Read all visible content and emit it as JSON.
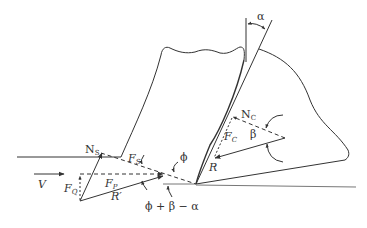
{
  "diagram": {
    "type": "orthogonal-cutting-force-diagram",
    "labels": {
      "alpha": "α",
      "phi": "ϕ",
      "beta": "β",
      "velocity": "V",
      "shear_normal": "N",
      "shear_normal_sub": "S",
      "shear_force": "F",
      "shear_force_sub": "S",
      "cutting_force": "F",
      "cutting_force_sub": "P",
      "thrust_force": "F",
      "thrust_force_sub": "Q",
      "resultant_prime": "R′",
      "tool_normal": "N",
      "tool_normal_sub": "C",
      "friction_force": "F",
      "friction_force_sub": "C",
      "resultant": "R",
      "angle_expr": "ϕ + β − α"
    },
    "colors": {
      "line": "#333333",
      "text": "#333333",
      "background": "#ffffff"
    }
  }
}
